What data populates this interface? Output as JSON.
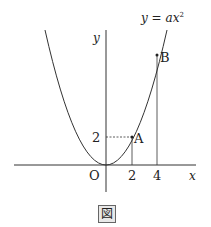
{
  "figure": {
    "caption": "図",
    "curve_label": "y = ax²",
    "curve_label_parts": {
      "y": "y",
      "eq": " = ",
      "a": "a",
      "x": "x",
      "exp": "2"
    },
    "axis_x_label": "x",
    "axis_y_label": "y",
    "origin_label": "O",
    "points": [
      {
        "name": "A",
        "x": 2,
        "y": 2
      },
      {
        "name": "B",
        "x": 4,
        "y": 8
      }
    ],
    "ticks": {
      "x": [
        "2",
        "4"
      ],
      "y": [
        "2"
      ]
    },
    "colors": {
      "line": "#333333",
      "background": "#ffffff"
    }
  }
}
